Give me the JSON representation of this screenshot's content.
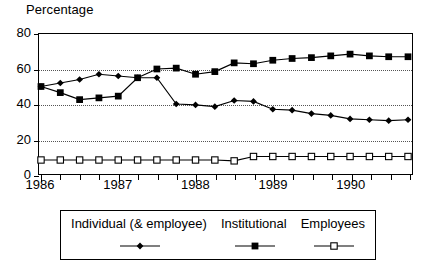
{
  "chart_data": {
    "type": "line",
    "title": "",
    "ylabel": "Percentage",
    "xlabel": "",
    "ylim": [
      0,
      80
    ],
    "yticks": [
      0,
      20,
      40,
      60,
      80
    ],
    "ytick_labels": [
      "0",
      "20",
      "40",
      "60",
      "80"
    ],
    "grid": true,
    "grid_axis": "y",
    "legend_position": "below",
    "x": [
      "1986 Q1",
      "1986 Q2",
      "1986 Q3",
      "1986 Q4",
      "1987 Q1",
      "1987 Q2",
      "1987 Q3",
      "1987 Q4",
      "1988 Q1",
      "1988 Q2",
      "1988 Q3",
      "1988 Q4",
      "1989 Q1",
      "1989 Q2",
      "1989 Q3",
      "1989 Q4",
      "1990 Q1",
      "1990 Q2",
      "1990 Q3",
      "1990 Q4"
    ],
    "xtick_labels": [
      "1986",
      "1987",
      "1988",
      "1989",
      "1990"
    ],
    "xtick_years": [
      1986,
      1987,
      1988,
      1989,
      1990
    ],
    "series": [
      {
        "name": "Individual (& employee)",
        "marker": "filled-diamond",
        "values": [
          50,
          52,
          54,
          57,
          56,
          55,
          55,
          40,
          39.5,
          38.5,
          42,
          41.5,
          37,
          36.5,
          34.5,
          33.5,
          31.5,
          31,
          30.5,
          31
        ]
      },
      {
        "name": "Institutional",
        "marker": "filled-square",
        "values": [
          50,
          46.5,
          42.5,
          43.5,
          44.5,
          55,
          60,
          60.5,
          57,
          58.5,
          63.5,
          63,
          65,
          66,
          66.5,
          67.5,
          68.5,
          67.5,
          67,
          67
        ]
      },
      {
        "name": "Employees",
        "marker": "open-square",
        "values": [
          8,
          8,
          8,
          8,
          8,
          8,
          8,
          8,
          8,
          8,
          7.5,
          10,
          10,
          10,
          10,
          10,
          10,
          10,
          10,
          10
        ]
      }
    ]
  },
  "legend": {
    "items": [
      {
        "label": "Individual (& employee)",
        "marker": "filled-diamond"
      },
      {
        "label": "Institutional",
        "marker": "filled-square"
      },
      {
        "label": "Employees",
        "marker": "open-square"
      }
    ]
  },
  "colors": {
    "line": "#000000",
    "frame": "#000000",
    "grid": "#555555",
    "background": "#ffffff"
  }
}
